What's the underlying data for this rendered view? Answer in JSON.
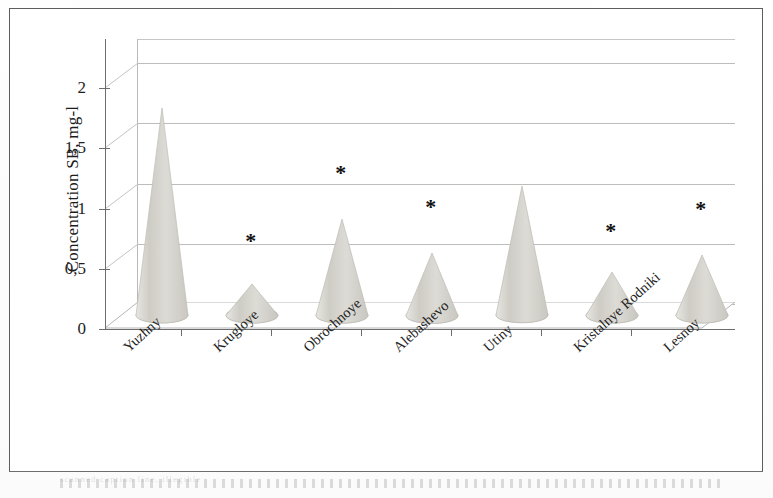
{
  "figure": {
    "kind": "3d-cone-chart",
    "background_color": "#ffffff",
    "frame_color": "#5d5d5d",
    "cone_fill_color": "#d6d3cc",
    "gridline_color": "#bdbdbd",
    "caption_remnant": "scanned caption line, illegible"
  },
  "chart_data": {
    "type": "bar",
    "title": "",
    "subtitle": "",
    "xlabel": "",
    "ylabel": "Concentration SB, mg-l",
    "ylim": [
      0,
      2.2
    ],
    "yticks": [
      0,
      0.5,
      1,
      1.5,
      2
    ],
    "ytick_labels": [
      "0",
      "0,5",
      "1",
      "1,5",
      "2"
    ],
    "decimal_separator": ",",
    "grid": true,
    "grid_axis": "y",
    "legend": false,
    "legend_position": "none",
    "categories": [
      "Yuzhny",
      "Krugloye",
      "Obrochnoye",
      "Alebashevo",
      "Utiny",
      "Kristalnye Rodniki",
      "Lesnoy"
    ],
    "values": [
      1.72,
      0.26,
      0.8,
      0.52,
      1.07,
      0.36,
      0.5
    ],
    "annotations": [
      {
        "category": "Krugloye",
        "marker": "*",
        "value_y": 0.62
      },
      {
        "category": "Obrochnoye",
        "marker": "*",
        "value_y": 1.18
      },
      {
        "category": "Alebashevo",
        "marker": "*",
        "value_y": 0.9
      },
      {
        "category": "Kristalnye Rodniki",
        "marker": "*",
        "value_y": 0.7
      },
      {
        "category": "Lesnoy",
        "marker": "*",
        "value_y": 0.88
      }
    ],
    "annotation_symbol": "*",
    "series": [
      {
        "name": "Concentration SB",
        "values": [
          1.72,
          0.26,
          0.8,
          0.52,
          1.07,
          0.36,
          0.5
        ]
      }
    ]
  }
}
